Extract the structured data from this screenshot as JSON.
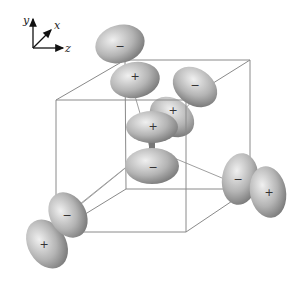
{
  "figure": {
    "axes": {
      "y_label": "y",
      "x_label": "x",
      "z_label": "z"
    },
    "colors": {
      "lobe_light": "#e6e6e6",
      "lobe_dark": "#7a7a7a",
      "edge": "#8a8a8a"
    },
    "lobes": [
      {
        "id": "top-upper",
        "sign": "−"
      },
      {
        "id": "top-lower",
        "sign": "+"
      },
      {
        "id": "upper-right-outer",
        "sign": "−"
      },
      {
        "id": "upper-right-inner",
        "sign": "+"
      },
      {
        "id": "center-upper",
        "sign": "+"
      },
      {
        "id": "center-lower",
        "sign": "−"
      },
      {
        "id": "right-inner",
        "sign": "−"
      },
      {
        "id": "right-outer",
        "sign": "+"
      },
      {
        "id": "left-inner",
        "sign": "−"
      },
      {
        "id": "left-outer",
        "sign": "+"
      }
    ]
  }
}
